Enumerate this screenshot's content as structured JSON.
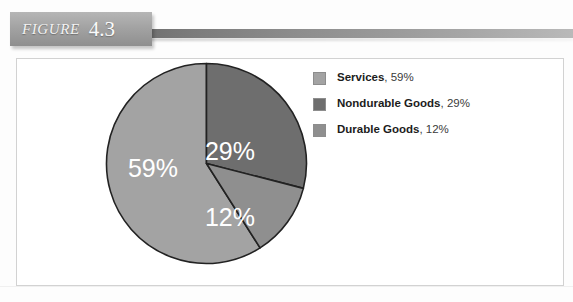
{
  "figure": {
    "label": "FIGURE",
    "number": "4.3"
  },
  "chart_data": {
    "type": "pie",
    "title": "",
    "categories": [
      "Services",
      "Nondurable Goods",
      "Durable Goods"
    ],
    "values": [
      59,
      29,
      12
    ],
    "value_suffix": "%",
    "slice_labels": [
      "59%",
      "29%",
      "12%"
    ],
    "colors": [
      "#a3a3a3",
      "#6e6e6e",
      "#8f8f8f"
    ],
    "legend_position": "right",
    "grid": false,
    "start_angle_deg": 0,
    "direction": "clockwise",
    "slice_label_color": "#ffffff",
    "slice_border_color": "#222222"
  },
  "legend": {
    "items": [
      {
        "name": "Services",
        "value": "59%",
        "separator": ", ",
        "color": "#a3a3a3"
      },
      {
        "name": "Nondurable Goods",
        "value": "29%",
        "separator": ", ",
        "color": "#6e6e6e"
      },
      {
        "name": "Durable Goods",
        "value": "12%",
        "separator": ", ",
        "color": "#8f8f8f"
      }
    ]
  },
  "slices": {
    "services": {
      "label": "59%",
      "x": 48,
      "y": 115,
      "color": "#a3a3a3"
    },
    "nondurable": {
      "label": "29%",
      "x": 125,
      "y": 98,
      "color": "#6e6e6e"
    },
    "durable": {
      "label": "12%",
      "x": 125,
      "y": 164,
      "color": "#8f8f8f"
    }
  },
  "colors": {
    "banner_top": "#b6b6b6",
    "banner_bottom": "#8f8f8f",
    "frame_border": "#d2d2d2",
    "page_background": "#ffffff"
  }
}
